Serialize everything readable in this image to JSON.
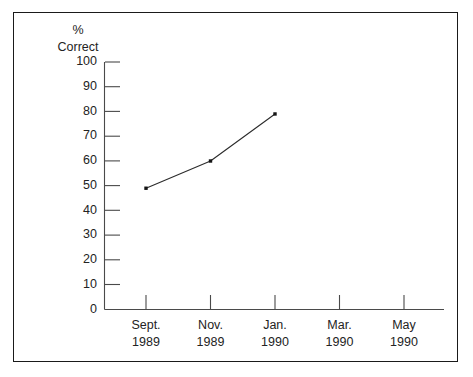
{
  "chart_data": {
    "type": "line",
    "title": "",
    "subtitle": "",
    "xlabel": "",
    "ylabel": "% Correct",
    "ylabel_lines": [
      "%",
      "Correct"
    ],
    "categories": [
      "Sept. 1989",
      "Nov. 1989",
      "Jan. 1990",
      "Mar. 1990",
      "May 1990"
    ],
    "category_lines": [
      [
        "Sept.",
        "1989"
      ],
      [
        "Nov.",
        "1989"
      ],
      [
        "Jan.",
        "1990"
      ],
      [
        "Mar.",
        "1990"
      ],
      [
        "May",
        "1990"
      ]
    ],
    "series": [
      {
        "name": "",
        "values": [
          49,
          60,
          79,
          null,
          null
        ]
      }
    ],
    "points": [
      {
        "x": "Sept. 1989",
        "y": 49
      },
      {
        "x": "Nov. 1989",
        "y": 60
      },
      {
        "x": "Jan. 1990",
        "y": 79
      }
    ],
    "ylim": [
      0,
      100
    ],
    "ytick_values": [
      0,
      10,
      20,
      30,
      40,
      50,
      60,
      70,
      80,
      90,
      100
    ],
    "ytick_labels": [
      "0",
      "10",
      "20",
      "30",
      "40",
      "50",
      "60",
      "70",
      "80",
      "90",
      "100"
    ],
    "grid": false,
    "legend": false,
    "legend_position": "none",
    "markers": "filled-square",
    "line_color": "#2b2b2b",
    "marker_color": "#151515",
    "axis_color": "#4a4a4a",
    "text_color": "#232323",
    "background_color": "#ffffff",
    "frame_color": "#1a1a1a"
  }
}
